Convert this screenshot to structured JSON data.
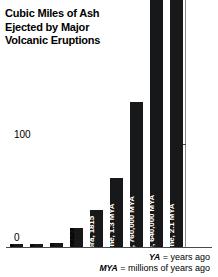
{
  "title": {
    "line1": "Cubic Miles of Ash",
    "line2": "Ejected by Major",
    "line3": "Volcanic Eruptions"
  },
  "axis": {
    "ticks": [
      {
        "label": "0",
        "value": 0
      },
      {
        "label": "100",
        "value": 100
      }
    ]
  },
  "footnote": {
    "ya_abbr": "YA",
    "ya_text": " = years ago",
    "mya_abbr": "MYA",
    "mya_text": " = millions of years ago"
  },
  "chart_data": {
    "type": "bar",
    "title": "Cubic Miles of Ash Ejected by Major Volcanic Eruptions",
    "xlabel": "",
    "ylabel": "Cubic miles of ash",
    "ylim": [
      0,
      240
    ],
    "grid": false,
    "legend": null,
    "axis_ticks": [
      0,
      100
    ],
    "categories": [
      "Mount St. Helens, 1980",
      "Mount Pinatubo, 1991",
      "Krakatau, 1883",
      "Mount Mazama, 7,600 YA",
      "Tambora, 1815",
      "Yellowstone, 1.3 MYA",
      "Long Valley, 760,000 MYA",
      "Yellowstone, 640,000 MYA",
      "Yellowstone, 2.1 MYA"
    ],
    "values": [
      0.24,
      2.4,
      4.3,
      18,
      36,
      67,
      140,
      240,
      240
    ],
    "value_labels": [
      ".24",
      "2.4",
      "4.3",
      "18",
      "36",
      "67",
      "140",
      "",
      ""
    ],
    "bars": [
      {
        "name": "Mount St. Helens, 1980",
        "value": 0.24,
        "value_label": ".24",
        "label_position": "above",
        "clipped": false
      },
      {
        "name": "Mount Pinatubo, 1991",
        "value": 2.4,
        "value_label": "2.4",
        "label_position": "above",
        "clipped": false
      },
      {
        "name": "Krakatau, 1883",
        "value": 4.3,
        "value_label": "4.3",
        "label_position": "above",
        "clipped": false
      },
      {
        "name": "Mount Mazama, 7,600 YA",
        "value": 18,
        "value_label": "18",
        "label_position": "above",
        "clipped": false
      },
      {
        "name": "Tambora, 1815",
        "value": 36,
        "value_label": "36",
        "label_position": "inside",
        "clipped": false
      },
      {
        "name": "Yellowstone, 1.3 MYA",
        "value": 67,
        "value_label": "67",
        "label_position": "inside",
        "clipped": false
      },
      {
        "name": "Long Valley, 760,000 MYA",
        "value": 140,
        "value_label": "140",
        "label_position": "inside",
        "clipped": false
      },
      {
        "name": "Yellowstone, 640,000 MYA",
        "value": 240,
        "value_label": "",
        "label_position": "inside",
        "clipped": true
      },
      {
        "name": "Yellowstone, 2.1 MYA",
        "value": 240,
        "value_label": "",
        "label_position": "inside",
        "clipped": true
      }
    ]
  },
  "colors": {
    "bar": "#17181a",
    "background": "#ffffff",
    "axis": "#4a4a4a",
    "inside_label": "#ffffff",
    "outside_label": "#000000"
  }
}
